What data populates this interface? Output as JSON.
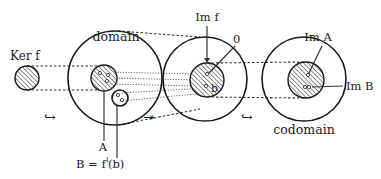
{
  "diagram": {
    "labels": {
      "kernel": "Ker f",
      "domain": "domain",
      "image": "Im f",
      "zero": "0",
      "b_point": "b",
      "im_a": "Im A",
      "im_b": "Im B",
      "codomain": "codomain",
      "subset_a": "A",
      "preimage_b": "B = f",
      "preimage_sup": "-1",
      "preimage_arg": "(b)"
    },
    "arrows": {
      "injection_1": "↪",
      "surjection": "↠",
      "injection_2": "↪"
    },
    "colors": {
      "stroke": "#1a1a1a",
      "hatch": "#555555",
      "text": "#222222"
    }
  }
}
